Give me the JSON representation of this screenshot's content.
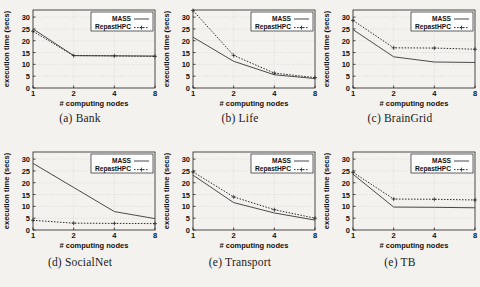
{
  "figure": {
    "panel_count": 6,
    "shared": {
      "xlabel": "# computing nodes",
      "ylabel": "execution time (secs)",
      "xticks": [
        "1",
        "2",
        "4",
        "8"
      ],
      "yticks": [
        "0",
        "5",
        "10",
        "15",
        "20",
        "25",
        "30"
      ],
      "legend": [
        {
          "name": "MASS",
          "style": "solid",
          "color": "#555555"
        },
        {
          "name": "RepastHPC",
          "style": "dotted",
          "color": "#333333"
        }
      ]
    }
  },
  "chart_data": [
    {
      "type": "line",
      "panel": "a",
      "caption": "(a) Bank",
      "title": "Bank",
      "xlabel": "# computing nodes",
      "ylabel": "execution time (secs)",
      "x": [
        1,
        2,
        4,
        8
      ],
      "xticklabels": [
        "1",
        "2",
        "4",
        "8"
      ],
      "xscale": "log2",
      "ylim": [
        0,
        33
      ],
      "yticks": [
        0,
        5,
        10,
        15,
        20,
        25,
        30
      ],
      "grid": true,
      "legend_position": "top-right",
      "series": [
        {
          "name": "MASS",
          "style": "solid",
          "values": [
            25.0,
            13.7,
            13.6,
            13.5
          ]
        },
        {
          "name": "RepastHPC",
          "style": "dotted",
          "values": [
            24.0,
            13.7,
            13.6,
            13.4
          ]
        }
      ]
    },
    {
      "type": "line",
      "panel": "b",
      "caption": "(b) Life",
      "title": "Life",
      "xlabel": "# computing nodes",
      "ylabel": "execution time (secs)",
      "x": [
        1,
        2,
        4,
        8
      ],
      "xticklabels": [
        "1",
        "2",
        "4",
        "8"
      ],
      "xscale": "log2",
      "ylim": [
        0,
        33
      ],
      "yticks": [
        0,
        5,
        10,
        15,
        20,
        25,
        30
      ],
      "grid": true,
      "legend_position": "top-right",
      "series": [
        {
          "name": "MASS",
          "style": "solid",
          "values": [
            21.5,
            11.3,
            5.6,
            4.0
          ]
        },
        {
          "name": "RepastHPC",
          "style": "dotted",
          "values": [
            32.8,
            13.8,
            6.3,
            4.4
          ]
        }
      ]
    },
    {
      "type": "line",
      "panel": "c",
      "caption": "(c) BrainGrid",
      "title": "BrainGrid",
      "xlabel": "# computing nodes",
      "ylabel": "execution time (secs)",
      "x": [
        1,
        2,
        4,
        8
      ],
      "xticklabels": [
        "1",
        "2",
        "4",
        "8"
      ],
      "xscale": "log2",
      "ylim": [
        0,
        33
      ],
      "yticks": [
        0,
        5,
        10,
        15,
        20,
        25,
        30
      ],
      "grid": true,
      "legend_position": "top-right",
      "series": [
        {
          "name": "MASS",
          "style": "solid",
          "values": [
            24.7,
            13.2,
            11.0,
            10.8
          ]
        },
        {
          "name": "RepastHPC",
          "style": "dotted",
          "values": [
            28.6,
            17.0,
            16.9,
            16.4
          ]
        }
      ]
    },
    {
      "type": "line",
      "panel": "d",
      "caption": "(d) SocialNet",
      "title": "SocialNet",
      "xlabel": "# computing nodes",
      "ylabel": "execution time (secs)",
      "x": [
        1,
        2,
        4,
        8
      ],
      "xticklabels": [
        "1",
        "2",
        "4",
        "8"
      ],
      "xscale": "log2",
      "ylim": [
        0,
        33
      ],
      "yticks": [
        0,
        5,
        10,
        15,
        20,
        25,
        30
      ],
      "grid": true,
      "legend_position": "top-right",
      "series": [
        {
          "name": "MASS",
          "style": "solid",
          "values": [
            28.2,
            18.0,
            7.8,
            4.8
          ]
        },
        {
          "name": "RepastHPC",
          "style": "dotted",
          "values": [
            4.1,
            2.9,
            2.8,
            2.7
          ]
        }
      ]
    },
    {
      "type": "line",
      "panel": "e",
      "caption": "(e) Transport",
      "title": "Transport",
      "xlabel": "# computing nodes",
      "ylabel": "execution time (secs)",
      "x": [
        1,
        2,
        4,
        8
      ],
      "xticklabels": [
        "1",
        "2",
        "4",
        "8"
      ],
      "xscale": "log2",
      "ylim": [
        0,
        33
      ],
      "yticks": [
        0,
        5,
        10,
        15,
        20,
        25,
        30
      ],
      "grid": true,
      "legend_position": "top-right",
      "series": [
        {
          "name": "MASS",
          "style": "solid",
          "values": [
            23.2,
            11.6,
            7.2,
            4.2
          ]
        },
        {
          "name": "RepastHPC",
          "style": "dotted",
          "values": [
            24.6,
            14.0,
            8.6,
            5.0
          ]
        }
      ]
    },
    {
      "type": "line",
      "panel": "f",
      "caption": "(e) TB",
      "title": "TB",
      "xlabel": "# computing nodes",
      "ylabel": "execution time (secs)",
      "x": [
        1,
        2,
        4,
        8
      ],
      "xticklabels": [
        "1",
        "2",
        "4",
        "8"
      ],
      "xscale": "log2",
      "ylim": [
        0,
        33
      ],
      "yticks": [
        0,
        5,
        10,
        15,
        20,
        25,
        30
      ],
      "grid": true,
      "legend_position": "top-right",
      "series": [
        {
          "name": "MASS",
          "style": "solid",
          "values": [
            23.6,
            9.7,
            9.6,
            9.4
          ]
        },
        {
          "name": "RepastHPC",
          "style": "dotted",
          "values": [
            24.4,
            13.1,
            13.0,
            12.7
          ]
        }
      ]
    }
  ]
}
